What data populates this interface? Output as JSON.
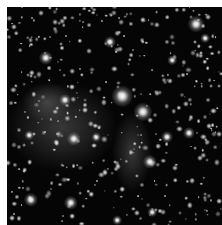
{
  "image": {
    "subject": "Dense star field / star cluster in grayscale",
    "background_color": "#050505",
    "border_color": "#ffffff",
    "haze": [
      {
        "x": 55,
        "y": 120,
        "w": 110,
        "h": 90
      },
      {
        "x": 125,
        "y": 145,
        "w": 40,
        "h": 80
      },
      {
        "x": 40,
        "y": 95,
        "w": 50,
        "h": 40
      }
    ],
    "bright_stars": [
      {
        "x": 115,
        "y": 89,
        "r": 9
      },
      {
        "x": 136,
        "y": 105,
        "r": 8
      },
      {
        "x": 189,
        "y": 17,
        "r": 7
      },
      {
        "x": 39,
        "y": 51,
        "r": 6
      },
      {
        "x": 67,
        "y": 132,
        "r": 6
      },
      {
        "x": 143,
        "y": 155,
        "r": 6
      },
      {
        "x": 24,
        "y": 193,
        "r": 6
      },
      {
        "x": 64,
        "y": 196,
        "r": 6
      },
      {
        "x": 182,
        "y": 126,
        "r": 5
      },
      {
        "x": 160,
        "y": 130,
        "r": 5
      },
      {
        "x": 103,
        "y": 35,
        "r": 5
      },
      {
        "x": 58,
        "y": 93,
        "r": 5
      },
      {
        "x": 198,
        "y": 31,
        "r": 4
      },
      {
        "x": 22,
        "y": 128,
        "r": 4
      },
      {
        "x": 89,
        "y": 130,
        "r": 4
      },
      {
        "x": 165,
        "y": 53,
        "r": 4
      },
      {
        "x": 110,
        "y": 213,
        "r": 4
      },
      {
        "x": 145,
        "y": 205,
        "r": 4
      }
    ]
  }
}
